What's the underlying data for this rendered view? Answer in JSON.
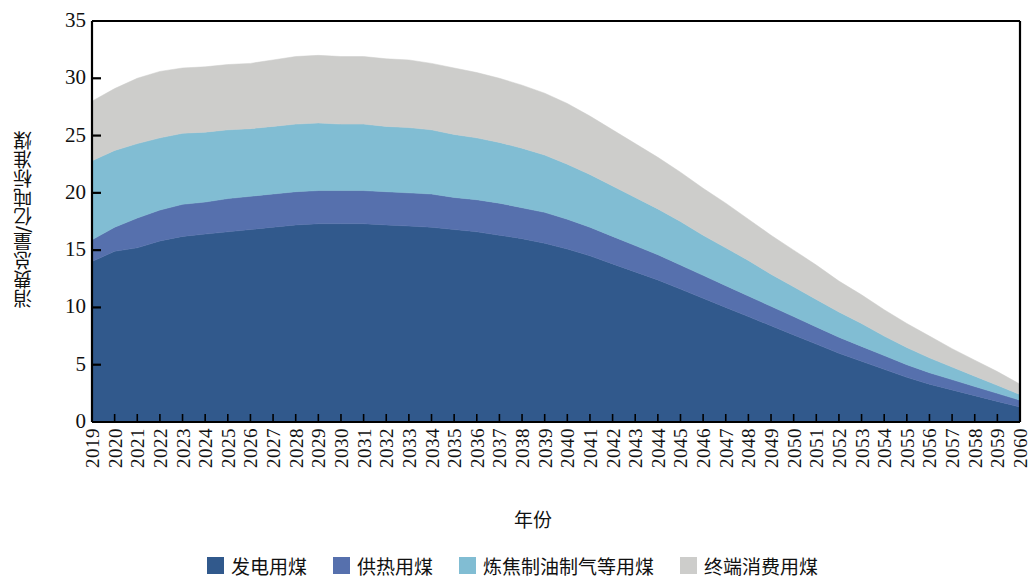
{
  "axes": {
    "ylabel": "消费总量/亿吨标准煤",
    "xlabel": "年份",
    "yticks": [
      "0",
      "5",
      "10",
      "15",
      "20",
      "25",
      "30",
      "35"
    ]
  },
  "legend": {
    "items": [
      {
        "label": "发电用煤",
        "color": "#31598c"
      },
      {
        "label": "供热用煤",
        "color": "#5670ad"
      },
      {
        "label": "炼焦制油制气等用煤",
        "color": "#81bdd3"
      },
      {
        "label": "终端消费用煤",
        "color": "#cdcdcb"
      }
    ]
  },
  "chart_data": {
    "type": "area",
    "title": "",
    "xlabel": "年份",
    "ylabel": "消费总量/亿吨标准煤",
    "ylim": [
      0,
      35
    ],
    "ytick_step": 5,
    "grid": false,
    "stacked": true,
    "legend_position": "bottom",
    "categories": [
      "2019",
      "2020",
      "2021",
      "2022",
      "2023",
      "2024",
      "2025",
      "2026",
      "2027",
      "2028",
      "2029",
      "2030",
      "2031",
      "2032",
      "2033",
      "2034",
      "2035",
      "2036",
      "2037",
      "2038",
      "2039",
      "2040",
      "2041",
      "2042",
      "2043",
      "2044",
      "2045",
      "2046",
      "2047",
      "2048",
      "2049",
      "2050",
      "2051",
      "2052",
      "2053",
      "2054",
      "2055",
      "2056",
      "2057",
      "2058",
      "2059",
      "2060"
    ],
    "series": [
      {
        "name": "发电用煤",
        "color": "#31598c",
        "values": [
          14.0,
          14.9,
          15.2,
          15.8,
          16.2,
          16.4,
          16.6,
          16.8,
          17.0,
          17.2,
          17.3,
          17.3,
          17.3,
          17.2,
          17.1,
          17.0,
          16.8,
          16.6,
          16.3,
          16.0,
          15.6,
          15.1,
          14.5,
          13.8,
          13.1,
          12.4,
          11.6,
          10.8,
          10.0,
          9.2,
          8.4,
          7.6,
          6.8,
          6.0,
          5.3,
          4.6,
          3.9,
          3.3,
          2.8,
          2.3,
          1.8,
          1.3
        ]
      },
      {
        "name": "供热用煤",
        "color": "#5670ad",
        "values": [
          1.9,
          2.1,
          2.6,
          2.7,
          2.8,
          2.8,
          2.9,
          2.9,
          2.9,
          2.9,
          2.9,
          2.9,
          2.9,
          2.9,
          2.9,
          2.9,
          2.8,
          2.8,
          2.8,
          2.7,
          2.7,
          2.6,
          2.5,
          2.4,
          2.3,
          2.2,
          2.1,
          2.0,
          1.9,
          1.8,
          1.7,
          1.6,
          1.5,
          1.4,
          1.3,
          1.2,
          1.1,
          1.0,
          0.9,
          0.8,
          0.7,
          0.6
        ]
      },
      {
        "name": "炼焦制油制气等用煤",
        "color": "#81bdd3",
        "values": [
          6.9,
          6.7,
          6.5,
          6.3,
          6.2,
          6.1,
          6.0,
          5.9,
          5.9,
          5.9,
          5.9,
          5.8,
          5.8,
          5.7,
          5.7,
          5.6,
          5.5,
          5.4,
          5.3,
          5.2,
          5.0,
          4.8,
          4.6,
          4.4,
          4.2,
          4.0,
          3.8,
          3.5,
          3.3,
          3.1,
          2.8,
          2.6,
          2.4,
          2.2,
          2.0,
          1.7,
          1.5,
          1.3,
          1.1,
          0.9,
          0.7,
          0.5
        ]
      },
      {
        "name": "终端消费用煤",
        "color": "#cdcdcb",
        "values": [
          5.2,
          5.4,
          5.7,
          5.8,
          5.7,
          5.7,
          5.7,
          5.7,
          5.8,
          5.9,
          5.9,
          5.9,
          5.9,
          5.9,
          5.9,
          5.8,
          5.8,
          5.7,
          5.6,
          5.5,
          5.4,
          5.3,
          5.1,
          4.9,
          4.7,
          4.5,
          4.3,
          4.1,
          3.9,
          3.6,
          3.4,
          3.2,
          3.0,
          2.7,
          2.5,
          2.3,
          2.1,
          1.9,
          1.6,
          1.4,
          1.2,
          0.9
        ]
      }
    ],
    "totals": [
      28.0,
      29.1,
      30.0,
      30.6,
      30.9,
      31.0,
      31.2,
      31.3,
      31.6,
      31.9,
      32.0,
      31.9,
      31.9,
      31.7,
      31.6,
      31.3,
      30.9,
      30.5,
      30.0,
      29.4,
      28.7,
      27.8,
      26.7,
      25.5,
      24.3,
      23.1,
      21.8,
      20.4,
      19.1,
      17.7,
      16.3,
      15.0,
      13.7,
      12.3,
      11.1,
      9.8,
      8.6,
      7.5,
      6.4,
      5.4,
      4.4,
      3.3
    ]
  }
}
